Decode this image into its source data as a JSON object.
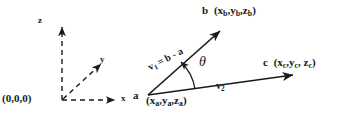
{
  "figure": {
    "type": "vector-geometry-diagram",
    "background_color": "#ffffff",
    "ink_color": "#1a1a1a",
    "axes": {
      "origin_label": "(0,0,0)",
      "z_label": "z",
      "y_label": "y",
      "x_label": "x",
      "line_style": "dashed",
      "arrowheads": "solid"
    },
    "points": {
      "a_name": "a",
      "a_coords": "(x",
      "a_coords_full": "(xa,ya,za)",
      "b_name": "b",
      "b_coords_full": "(xb,yb,zb)",
      "c_name": "c",
      "c_coords_full": "(xc,yc,zc)"
    },
    "labels": {
      "point_a_letter": "a",
      "point_a_open": "(x",
      "point_a_sub1": "a",
      "point_a_mid1": ",y",
      "point_a_sub2": "a",
      "point_a_mid2": ",z",
      "point_a_sub3": "a",
      "point_a_close": ")",
      "point_b_letter": "b",
      "point_b_open": "(x",
      "point_b_sub1": "b",
      "point_b_mid1": ",y",
      "point_b_sub2": "b",
      "point_b_mid2": ",z",
      "point_b_sub3": "b",
      "point_b_close": ")",
      "point_c_letter": "c",
      "point_c_open": "(x",
      "point_c_sub1": "c",
      "point_c_mid1": ",y",
      "point_c_sub2": "c",
      "point_c_mid2": ", z",
      "point_c_sub3": "c",
      "point_c_close": ")",
      "v1_name": "v",
      "v1_sub": "1",
      "v1_expr": "= b - a",
      "v2_name": "v",
      "v2_sub": "2",
      "angle_symbol": "θ"
    },
    "geometry": {
      "origin_px": [
        62,
        100
      ],
      "z_tip_px": [
        62,
        22
      ],
      "y_tip_px": [
        104,
        62
      ],
      "x_tip_px": [
        118,
        100
      ],
      "a_px": [
        148,
        95
      ],
      "b_tip_px": [
        224,
        28
      ],
      "c_tip_px": [
        297,
        74
      ]
    }
  }
}
